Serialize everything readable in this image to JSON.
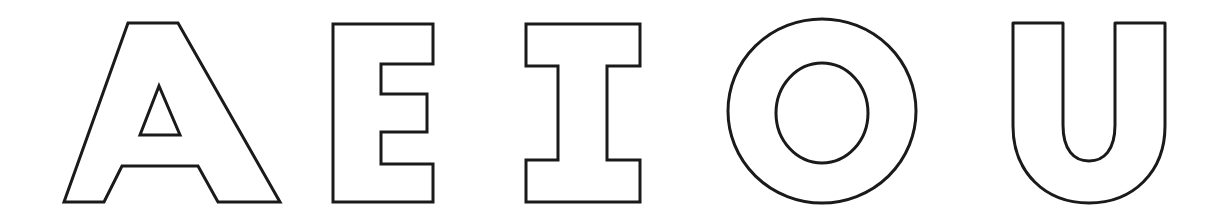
{
  "page": {
    "kind": "letter-outline-worksheet",
    "background_color": "#ffffff",
    "stroke_color": "#1a1a1a",
    "fill_color": "#ffffff",
    "stroke_width_px": 3,
    "width_px": 1216,
    "height_px": 215,
    "text_content": "A E I O U"
  },
  "letters": [
    {
      "id": "letter-a",
      "character": "A",
      "name": "capital-letter-a",
      "style": "sans-serif-block-outline",
      "bounds": {
        "x": 64,
        "y": 22,
        "width": 216,
        "height": 180
      },
      "counters": 1
    },
    {
      "id": "letter-e",
      "character": "E",
      "name": "capital-letter-e",
      "style": "sans-serif-block-outline",
      "bounds": {
        "x": 333,
        "y": 24,
        "width": 101,
        "height": 178
      },
      "counters": 0
    },
    {
      "id": "letter-i",
      "character": "I",
      "name": "capital-letter-i",
      "style": "slab-serif-block-outline",
      "bounds": {
        "x": 526,
        "y": 24,
        "width": 114,
        "height": 178
      },
      "counters": 0
    },
    {
      "id": "letter-o",
      "character": "O",
      "name": "capital-letter-o",
      "style": "circular-ring-outline",
      "bounds": {
        "x": 728,
        "y": 19,
        "width": 188,
        "height": 184
      },
      "counters": 1
    },
    {
      "id": "letter-u",
      "character": "U",
      "name": "capital-letter-u",
      "style": "sans-serif-block-outline",
      "bounds": {
        "x": 1013,
        "y": 23,
        "width": 152,
        "height": 180
      },
      "counters": 0
    }
  ]
}
